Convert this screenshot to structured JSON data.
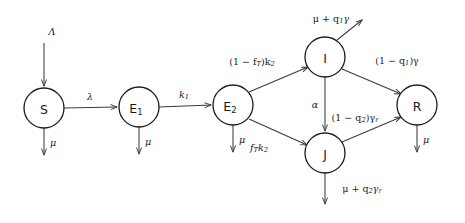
{
  "diagram": {
    "type": "compartmental-flow",
    "colors": {
      "stroke": "#1a1a1a",
      "arrow": "#3a3a3a",
      "background": "#ffffff"
    },
    "nodes": [
      {
        "id": "S",
        "label": "S",
        "sub": "",
        "cx": 44,
        "cy": 108,
        "r": 20
      },
      {
        "id": "E1",
        "label": "E",
        "sub": "1",
        "cx": 139,
        "cy": 107,
        "r": 20
      },
      {
        "id": "E2",
        "label": "E",
        "sub": "2",
        "cx": 233,
        "cy": 105,
        "r": 20
      },
      {
        "id": "I",
        "label": "I",
        "sub": "",
        "cx": 325,
        "cy": 57,
        "r": 20
      },
      {
        "id": "J",
        "label": "J",
        "sub": "",
        "cx": 325,
        "cy": 153,
        "r": 20
      },
      {
        "id": "R",
        "label": "R",
        "sub": "",
        "cx": 417,
        "cy": 105,
        "r": 20
      }
    ],
    "flows": [
      {
        "id": "inflow-lambda-cap",
        "from": "external",
        "to": "S",
        "label": "Λ"
      },
      {
        "id": "s-to-e1",
        "from": "S",
        "to": "E1",
        "label": "λ"
      },
      {
        "id": "e1-to-e2",
        "from": "E1",
        "to": "E2",
        "label_pre": "k",
        "label_sub": "1"
      },
      {
        "id": "e2-to-i",
        "from": "E2",
        "to": "I",
        "label_pre": "(1 − f",
        "label_sub": "T",
        "label_post": ")k",
        "label_sub2": "2"
      },
      {
        "id": "e2-to-j",
        "from": "E2",
        "to": "J",
        "label_pre": "f",
        "label_sub": "T",
        "label_post": "k",
        "label_sub2": "2"
      },
      {
        "id": "i-to-j",
        "from": "I",
        "to": "J",
        "label": "α"
      },
      {
        "id": "i-to-r",
        "from": "I",
        "to": "R",
        "label_pre": "(1 − q",
        "label_sub": "1",
        "label_post": ")γ"
      },
      {
        "id": "j-to-r",
        "from": "J",
        "to": "R",
        "label_pre": "(1 − q",
        "label_sub": "2",
        "label_post": ")γ",
        "label_sub2": "r"
      }
    ],
    "outflows": [
      {
        "id": "s-mu",
        "from": "S",
        "label": "μ",
        "direction": "down"
      },
      {
        "id": "e1-mu",
        "from": "E1",
        "label": "μ",
        "direction": "down"
      },
      {
        "id": "e2-mu",
        "from": "E2",
        "label": "μ",
        "direction": "down"
      },
      {
        "id": "r-mu",
        "from": "R",
        "label": "μ",
        "direction": "down"
      },
      {
        "id": "i-out",
        "from": "I",
        "label_pre": "μ + q",
        "label_sub": "1",
        "label_post": "γ",
        "direction": "up-right"
      },
      {
        "id": "j-out",
        "from": "J",
        "label_pre": "μ + q",
        "label_sub": "2",
        "label_post": "γ",
        "label_sub2": "r",
        "direction": "down"
      }
    ]
  }
}
